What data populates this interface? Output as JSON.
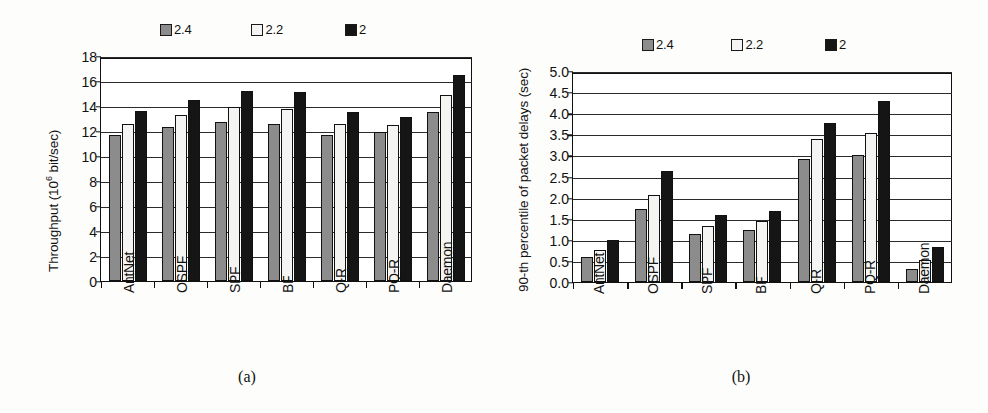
{
  "figure": {
    "caption_a": "(a)",
    "caption_b": "(b)",
    "colors": {
      "series_2_4": "#8c8c8c",
      "series_2_2": "#f4f4f2",
      "series_2": "#151515",
      "axis": "#111111",
      "grid": "#2b2b2b",
      "background": "#ffffff"
    }
  },
  "legend": {
    "items": [
      {
        "label": "2.4",
        "swatch": "gray-swatch-icon"
      },
      {
        "label": "2.2",
        "swatch": "white-swatch-icon"
      },
      {
        "label": "2",
        "swatch": "black-swatch-icon"
      }
    ]
  },
  "chart_data": [
    {
      "type": "bar",
      "panel": "a",
      "title": "",
      "xlabel": "",
      "ylabel": "Throughput (10⁶ bit/sec)",
      "ylabel_prefix": "Throughput (10",
      "ylabel_sup": "6",
      "ylabel_suffix": " bit/sec)",
      "ylim": [
        0,
        18
      ],
      "ytick_step": 2,
      "yticks": [
        "0",
        "2",
        "4",
        "6",
        "8",
        "10",
        "12",
        "14",
        "16",
        "18"
      ],
      "grid": true,
      "legend_position": "top",
      "categories": [
        "AntNet",
        "OSPF",
        "SPF",
        "BF",
        "Q-R",
        "PQ-R",
        "Daemon"
      ],
      "series": [
        {
          "name": "2.4",
          "values": [
            11.7,
            12.3,
            12.7,
            12.6,
            11.7,
            11.9,
            13.5
          ]
        },
        {
          "name": "2.2",
          "values": [
            12.6,
            13.3,
            13.9,
            13.8,
            12.6,
            12.5,
            14.9
          ]
        },
        {
          "name": "2",
          "values": [
            13.6,
            14.5,
            15.2,
            15.1,
            13.5,
            13.1,
            16.5
          ]
        }
      ]
    },
    {
      "type": "bar",
      "panel": "b",
      "title": "",
      "xlabel": "",
      "ylabel": "90-th percentile of packet delays (sec)",
      "ylim": [
        0.0,
        5.0
      ],
      "ytick_step": 0.5,
      "yticks": [
        "0.0",
        "0.5",
        "1.0",
        "1.5",
        "2.0",
        "2.5",
        "3.0",
        "3.5",
        "4.0",
        "4.5",
        "5.0"
      ],
      "grid": true,
      "legend_position": "top",
      "categories": [
        "AntNet",
        "OSPF",
        "SPF",
        "BF",
        "Q-R",
        "PQ-R",
        "Daemon"
      ],
      "series": [
        {
          "name": "2.4",
          "values": [
            0.6,
            1.73,
            1.13,
            1.24,
            2.92,
            3.01,
            0.31
          ]
        },
        {
          "name": "2.2",
          "values": [
            0.76,
            2.07,
            1.33,
            1.44,
            3.4,
            3.52,
            0.51
          ]
        },
        {
          "name": "2",
          "values": [
            1.0,
            2.62,
            1.58,
            1.69,
            3.77,
            4.28,
            0.82
          ]
        }
      ]
    }
  ]
}
